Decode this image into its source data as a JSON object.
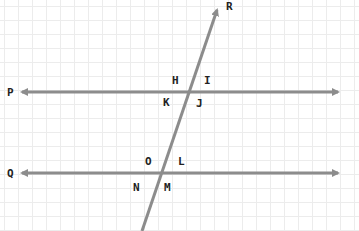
{
  "diagram": {
    "line_color": "#8c8c8c",
    "label_color": "#222222",
    "grid_color": "#ececec",
    "lines": [
      {
        "name": "P",
        "label": "P",
        "x1": 22,
        "y1": 92,
        "x2": 338,
        "y2": 92,
        "arrows": "both"
      },
      {
        "name": "Q",
        "label": "Q",
        "x1": 22,
        "y1": 173,
        "x2": 338,
        "y2": 173,
        "arrows": "both"
      },
      {
        "name": "R",
        "label": "R",
        "x1": 142,
        "y1": 231,
        "x2": 218,
        "y2": 8,
        "arrows": "end"
      }
    ],
    "angle_labels": {
      "upper": [
        "H",
        "I",
        "K",
        "J"
      ],
      "lower": [
        "O",
        "L",
        "N",
        "M"
      ]
    },
    "labels": {
      "P": "P",
      "Q": "Q",
      "R": "R",
      "H": "H",
      "I": "I",
      "K": "K",
      "J": "J",
      "O": "O",
      "L": "L",
      "N": "N",
      "M": "M"
    }
  }
}
